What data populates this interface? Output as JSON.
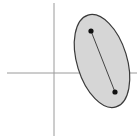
{
  "diagram": {
    "axes": {
      "vertical": {
        "x": 54,
        "y1": 3,
        "y2": 136,
        "color": "#9a9a9a"
      },
      "horizontal": {
        "y": 73,
        "x1": 7,
        "x2": 137,
        "color": "#9a9a9a"
      }
    },
    "ellipse": {
      "cx": 102,
      "cy": 61,
      "rx": 25,
      "ry": 48,
      "rotate": -17,
      "fill": "#d6d6d6",
      "stroke": "#3a3a3a"
    },
    "points": [
      {
        "x": 91,
        "y": 31
      },
      {
        "x": 115,
        "y": 92
      }
    ],
    "segment_color": "#333333",
    "point_color": "#111111"
  }
}
